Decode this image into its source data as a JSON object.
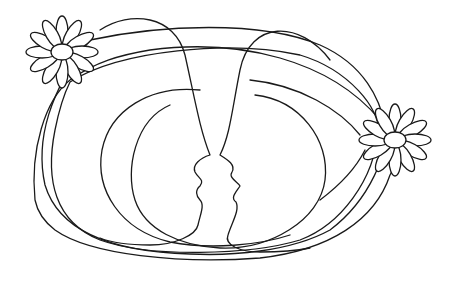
{
  "artwork": {
    "title": "Two faces in continuous line with daisies",
    "ink_color": "#1a1a1a",
    "background": "#ffffff"
  },
  "elements": {
    "left_face": "face-profile-left",
    "right_face": "face-profile-right",
    "left_daisy": "daisy-top-left",
    "right_daisy": "daisy-right"
  }
}
